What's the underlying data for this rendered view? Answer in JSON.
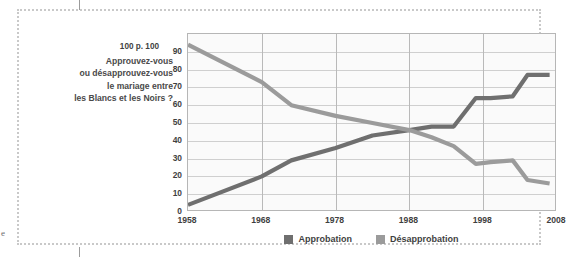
{
  "figure": {
    "question_lines": [
      "Approuvez-vous",
      "ou désapprouvez-vous",
      "le mariage entre",
      "les Blancs et les Noirs ?"
    ],
    "unit_label": "100 p. 100",
    "edge_letter": "e"
  },
  "chart_data": {
    "type": "line",
    "title": "Approuvez-vous ou désapprouvez-vous le mariage entre les Blancs et les Noirs ?",
    "xlabel": "",
    "ylabel": "100 p. 100",
    "xlim": [
      1958,
      2008
    ],
    "ylim": [
      0,
      100
    ],
    "grid": "horizontal-and-vertical",
    "legend_position": "bottom-center",
    "xticks": [
      "1958",
      "1968",
      "1978",
      "1988",
      "1998",
      "2008"
    ],
    "xtick_values": [
      1958,
      1968,
      1978,
      1988,
      1998,
      2008
    ],
    "yticks": [
      "0",
      "10",
      "20",
      "30",
      "40",
      "50",
      "60",
      "70",
      "80",
      "90",
      "100"
    ],
    "ytick_values": [
      0,
      10,
      20,
      30,
      40,
      50,
      60,
      70,
      80,
      90,
      100
    ],
    "series": [
      {
        "name": "Approbation",
        "color": "#6f6f6f",
        "x": [
          1958,
          1968,
          1972,
          1978,
          1983,
          1988,
          1991,
          1994,
          1997,
          1999,
          2002,
          2004,
          2007
        ],
        "values": [
          4,
          20,
          29,
          36,
          43,
          46,
          48,
          48,
          64,
          64,
          65,
          77,
          77
        ]
      },
      {
        "name": "Désapprobation",
        "color": "#9b9b9b",
        "x": [
          1958,
          1968,
          1972,
          1978,
          1983,
          1988,
          1991,
          1994,
          1997,
          1999,
          2002,
          2004,
          2007
        ],
        "values": [
          94,
          73,
          60,
          54,
          50,
          46,
          42,
          37,
          27,
          28,
          29,
          18,
          16
        ]
      }
    ]
  },
  "legend": {
    "items": [
      {
        "label": "Approbation",
        "color": "#6f6f6f"
      },
      {
        "label": "Désapprobation",
        "color": "#9b9b9b"
      }
    ]
  }
}
